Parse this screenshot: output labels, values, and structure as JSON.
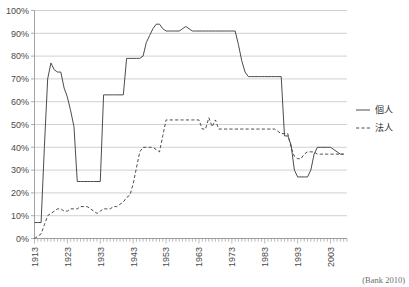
{
  "chart_data": {
    "type": "line",
    "title": "",
    "xlabel": "",
    "ylabel": "",
    "xlim": [
      1913,
      2008
    ],
    "ylim": [
      0,
      100
    ],
    "grid": true,
    "legend_position": "right",
    "y_ticks": [
      "0%",
      "10%",
      "20%",
      "30%",
      "40%",
      "50%",
      "60%",
      "70%",
      "80%",
      "90%",
      "100%"
    ],
    "y_tick_values": [
      0,
      10,
      20,
      30,
      40,
      50,
      60,
      70,
      80,
      90,
      100
    ],
    "x_ticks": [
      "1913",
      "1923",
      "1933",
      "1943",
      "1953",
      "1963",
      "1973",
      "1983",
      "1993",
      "2003"
    ],
    "x_tick_values": [
      1913,
      1923,
      1933,
      1943,
      1953,
      1963,
      1973,
      1983,
      1993,
      2003
    ],
    "series": [
      {
        "name": "個人",
        "style": "solid",
        "color": "#4c4c4c",
        "x": [
          1913,
          1914,
          1915,
          1916,
          1917,
          1918,
          1919,
          1920,
          1921,
          1922,
          1923,
          1924,
          1925,
          1926,
          1927,
          1928,
          1929,
          1930,
          1931,
          1932,
          1933,
          1934,
          1935,
          1936,
          1937,
          1938,
          1939,
          1940,
          1941,
          1942,
          1943,
          1944,
          1945,
          1946,
          1947,
          1948,
          1949,
          1950,
          1951,
          1952,
          1953,
          1954,
          1955,
          1956,
          1957,
          1958,
          1959,
          1960,
          1961,
          1962,
          1963,
          1964,
          1965,
          1966,
          1967,
          1968,
          1969,
          1970,
          1971,
          1972,
          1973,
          1974,
          1975,
          1976,
          1977,
          1978,
          1979,
          1980,
          1981,
          1982,
          1983,
          1984,
          1985,
          1986,
          1987,
          1988,
          1989,
          1990,
          1991,
          1992,
          1993,
          1994,
          1995,
          1996,
          1997,
          1998,
          1999,
          2000,
          2001,
          2002,
          2003,
          2004,
          2005,
          2006,
          2007
        ],
        "values": [
          7,
          7,
          7,
          40,
          70,
          77,
          74,
          73,
          73,
          66,
          62,
          56,
          49,
          25,
          25,
          25,
          25,
          25,
          25,
          25,
          25,
          63,
          63,
          63,
          63,
          63,
          63,
          63,
          79,
          79,
          79,
          79,
          79,
          80,
          86,
          89,
          92,
          94,
          94,
          92,
          91,
          91,
          91,
          91,
          91,
          92,
          93,
          92,
          91,
          91,
          91,
          91,
          91,
          91,
          91,
          91,
          91,
          91,
          91,
          91,
          91,
          91,
          85,
          78,
          73,
          71,
          71,
          71,
          71,
          71,
          71,
          71,
          71,
          71,
          71,
          71,
          45,
          45,
          41,
          30,
          27,
          27,
          27,
          27,
          30,
          37,
          40,
          40,
          40,
          40,
          40,
          39,
          38,
          37,
          37
        ]
      },
      {
        "name": "法人",
        "style": "dashed",
        "color": "#4c4c4c",
        "x": [
          1913,
          1914,
          1915,
          1916,
          1917,
          1918,
          1919,
          1920,
          1921,
          1922,
          1923,
          1924,
          1925,
          1926,
          1927,
          1928,
          1929,
          1930,
          1931,
          1932,
          1933,
          1934,
          1935,
          1936,
          1937,
          1938,
          1939,
          1940,
          1941,
          1942,
          1943,
          1944,
          1945,
          1946,
          1947,
          1948,
          1949,
          1950,
          1951,
          1952,
          1953,
          1954,
          1955,
          1956,
          1957,
          1958,
          1959,
          1960,
          1961,
          1962,
          1963,
          1964,
          1965,
          1966,
          1967,
          1968,
          1969,
          1970,
          1971,
          1972,
          1973,
          1974,
          1975,
          1976,
          1977,
          1978,
          1979,
          1980,
          1981,
          1982,
          1983,
          1984,
          1985,
          1986,
          1987,
          1988,
          1989,
          1990,
          1991,
          1992,
          1993,
          1994,
          1995,
          1996,
          1997,
          1998,
          1999,
          2000,
          2001,
          2002,
          2003,
          2004,
          2005,
          2006,
          2007
        ],
        "values": [
          0,
          1,
          2,
          6,
          10,
          11,
          12,
          13,
          13,
          12,
          12,
          13,
          13,
          13,
          14,
          14,
          14,
          13,
          12,
          11,
          12,
          13,
          13,
          13,
          14,
          14,
          15,
          16,
          18,
          19,
          24,
          31,
          38,
          40,
          40,
          40,
          40,
          39,
          38,
          45,
          52,
          52,
          52,
          52,
          52,
          52,
          52,
          52,
          52,
          52,
          52,
          48,
          48,
          53,
          49,
          52,
          48,
          48,
          48,
          48,
          48,
          48,
          48,
          48,
          48,
          48,
          48,
          48,
          48,
          48,
          48,
          48,
          48,
          48,
          47,
          46,
          46,
          46,
          40,
          36,
          35,
          35,
          37,
          38,
          38,
          38,
          37,
          37,
          37,
          37,
          37,
          37,
          37,
          37,
          37
        ]
      }
    ]
  },
  "legend": {
    "items": [
      {
        "label": "個人",
        "style": "solid"
      },
      {
        "label": "法人",
        "style": "dashed"
      }
    ]
  },
  "source": {
    "text": "(Bank 2010)"
  }
}
